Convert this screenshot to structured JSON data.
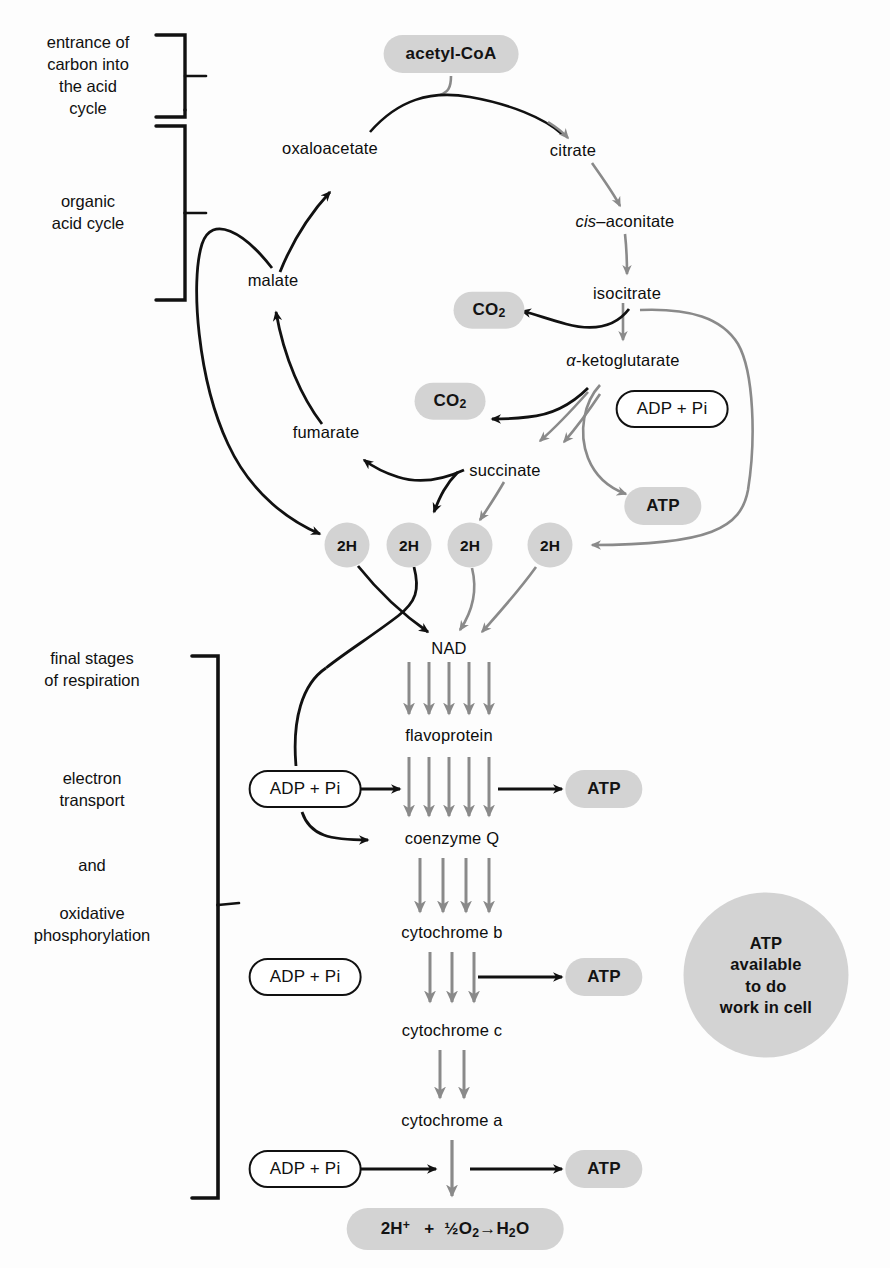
{
  "diagram": {
    "colors": {
      "pill_fill": "#d3d3d3",
      "gray_arrow": "#8a8a8a",
      "black_arrow": "#111111",
      "text": "#111111",
      "background": "#ffffff"
    }
  },
  "captions": [
    {
      "id": "entrance",
      "text": "entrance of\ncarbon into\nthe acid\ncycle"
    },
    {
      "id": "organic",
      "text": "organic\nacid cycle"
    },
    {
      "id": "final",
      "text": "final stages\nof respiration"
    },
    {
      "id": "electron",
      "text": "electron\ntransport"
    },
    {
      "id": "and",
      "text": "and"
    },
    {
      "id": "oxidative",
      "text": "oxidative\nphosphorylation"
    }
  ],
  "cycle": {
    "acetyl_coa": "acetyl-CoA",
    "oxaloacetate": "oxaloacetate",
    "citrate": "citrate",
    "cis_aconitate_italic": "cis",
    "cis_aconitate_rest": "–aconitate",
    "isocitrate": "isocitrate",
    "alpha_ketoglutarate_symbol": "α",
    "alpha_ketoglutarate_rest": "-ketoglutarate",
    "succinate": "succinate",
    "fumarate": "fumarate",
    "malate": "malate",
    "co2_upper": "CO",
    "co2_upper_sub": "2",
    "co2_lower": "CO",
    "co2_lower_sub": "2",
    "adp_pi": "ADP + Pi",
    "atp": "ATP"
  },
  "hydrogens": [
    {
      "label": "2H"
    },
    {
      "label": "2H"
    },
    {
      "label": "2H"
    },
    {
      "label": "2H"
    }
  ],
  "chain": {
    "nad": "NAD",
    "flavoprotein": "flavoprotein",
    "coenzyme_q": "coenzyme  Q",
    "cytochrome_b": "cytochrome b",
    "cytochrome_c": "cytochrome c",
    "cytochrome_a": "cytochrome a",
    "adp_pi_1": "ADP + Pi",
    "adp_pi_2": "ADP + Pi",
    "adp_pi_3": "ADP + Pi",
    "atp_1": "ATP",
    "atp_2": "ATP",
    "atp_3": "ATP",
    "final_reaction": {
      "h_count": "2H",
      "h_charge": "+",
      "plus": "+",
      "half": "½",
      "o": "O",
      "o_sub": "2",
      "arrow": "→",
      "h2o_h": "H",
      "h2o_sub": "2",
      "h2o_o": "O"
    }
  },
  "atp_pool": {
    "line1": "ATP",
    "line2": "available",
    "line3": "to do",
    "line4": "work in cell"
  }
}
